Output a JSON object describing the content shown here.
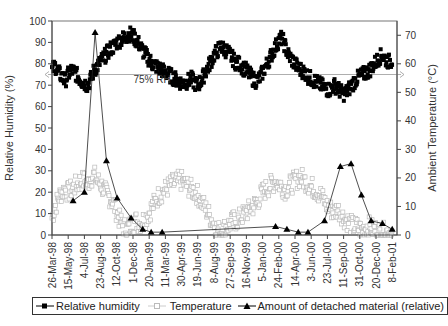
{
  "chart_data": {
    "type": "line",
    "title": "",
    "xlabel": "",
    "ylabel": "Relative  Humidity (%)",
    "ylabel_right": "Ambient Temperature (°C)",
    "ylim": [
      0,
      100
    ],
    "ylim_right": [
      0,
      75
    ],
    "yticks": [
      0,
      10,
      20,
      30,
      40,
      50,
      60,
      70,
      80,
      90,
      100
    ],
    "yticks_right": [
      0,
      10,
      20,
      30,
      40,
      50,
      60,
      70
    ],
    "grid": false,
    "legend_position": "bottom",
    "x_tick_labels": [
      "26-Mar-98",
      "15-May-98",
      "4-Jul-98",
      "23-Aug-98",
      "12-Oct-98",
      "1-Dec-98",
      "20-Jan-99",
      "11-Mar-99",
      "30-Apr-99",
      "19-Jun-99",
      "8-Aug-99",
      "27-Sep-99",
      "16-Nov-99",
      "5-Jan-00",
      "24-Feb-00",
      "14-Apr-00",
      "3-Jun-00",
      "23-Jul-00",
      "11-Sep-00",
      "31-Oct-00",
      "20-Dec-00",
      "8-Feb-01"
    ],
    "x_tick_interval_days": 50,
    "annotations": [
      {
        "text": "75% RH",
        "type": "horizontal_line",
        "axis": "left",
        "value": 75
      }
    ],
    "series": [
      {
        "name": "Relative humidity",
        "axis": "left",
        "marker": "filled-square",
        "color": "#000000",
        "x_days": [
          0,
          10,
          20,
          30,
          40,
          50,
          60,
          70,
          80,
          90,
          100,
          110,
          120,
          130,
          140,
          150,
          160,
          170,
          180,
          190,
          200,
          210,
          220,
          230,
          240,
          250,
          260,
          270,
          280,
          290,
          300,
          310,
          320,
          330,
          340,
          350,
          360,
          370,
          380,
          390,
          400,
          410,
          420,
          430,
          440,
          450,
          460,
          470,
          480,
          490,
          500,
          510,
          520,
          530,
          540,
          550,
          560,
          570,
          580,
          590,
          600,
          610,
          620,
          630,
          640,
          650,
          660,
          670,
          680,
          690,
          700,
          710,
          720,
          730,
          740,
          750,
          760,
          770,
          780,
          790,
          800,
          810,
          820,
          830,
          840,
          850,
          860,
          870,
          880,
          890,
          900,
          910,
          920,
          930,
          940,
          950,
          960,
          970,
          980,
          990,
          1000,
          1010,
          1020,
          1030,
          1040,
          1050
        ],
        "values": [
          77,
          79,
          76,
          74,
          72,
          75,
          77,
          76,
          74,
          72,
          71,
          70,
          73,
          77,
          79,
          81,
          83,
          85,
          87,
          88,
          90,
          91,
          92,
          93,
          94,
          93,
          91,
          89,
          86,
          84,
          82,
          80,
          79,
          78,
          77,
          76,
          75,
          74,
          73,
          72,
          71,
          71,
          72,
          73,
          71,
          70,
          72,
          75,
          78,
          81,
          84,
          86,
          88,
          87,
          86,
          84,
          82,
          80,
          80,
          78,
          77,
          75,
          73,
          72,
          73,
          76,
          79,
          82,
          85,
          88,
          91,
          92,
          88,
          84,
          82,
          80,
          78,
          77,
          76,
          74,
          73,
          72,
          71,
          70,
          69,
          68,
          68,
          70,
          69,
          67,
          66,
          67,
          69,
          71,
          73,
          74,
          75,
          76,
          77,
          79,
          81,
          83,
          84,
          82,
          81,
          82
        ]
      },
      {
        "name": "Temperature",
        "axis": "right",
        "marker": "hollow-square",
        "color": "#bbbbbb",
        "x_days": [
          0,
          10,
          20,
          30,
          40,
          50,
          60,
          70,
          80,
          90,
          100,
          110,
          120,
          130,
          140,
          150,
          160,
          170,
          180,
          190,
          200,
          210,
          220,
          230,
          240,
          250,
          260,
          270,
          280,
          290,
          300,
          310,
          320,
          330,
          340,
          350,
          360,
          370,
          380,
          390,
          400,
          410,
          420,
          430,
          440,
          450,
          460,
          470,
          480,
          490,
          500,
          510,
          520,
          530,
          540,
          550,
          560,
          570,
          580,
          590,
          600,
          610,
          620,
          630,
          640,
          650,
          660,
          670,
          680,
          690,
          700,
          710,
          720,
          730,
          740,
          750,
          760,
          770,
          780,
          790,
          800,
          810,
          820,
          830,
          840,
          850,
          860,
          870,
          880,
          890,
          900,
          910,
          920,
          930,
          940,
          950,
          960,
          970,
          980,
          990,
          1000,
          1010,
          1020,
          1030,
          1040,
          1050
        ],
        "values": [
          6,
          10,
          13,
          15,
          16,
          15,
          16,
          17,
          18,
          19,
          19,
          18,
          20,
          21,
          19,
          18,
          16,
          14,
          13,
          11,
          8,
          5,
          3,
          2,
          3,
          4,
          5,
          4,
          5,
          6,
          8,
          10,
          12,
          14,
          15,
          16,
          17,
          18,
          18,
          19,
          19,
          18,
          17,
          16,
          15,
          14,
          12,
          10,
          8,
          6,
          4,
          2,
          1,
          2,
          3,
          4,
          5,
          5,
          6,
          7,
          8,
          9,
          10,
          11,
          13,
          15,
          16,
          17,
          18,
          19,
          18,
          17,
          16,
          17,
          18,
          19,
          20,
          20,
          19,
          18,
          17,
          16,
          15,
          14,
          12,
          10,
          9,
          8,
          9,
          8,
          6,
          5,
          4,
          3,
          3,
          2,
          2,
          3,
          3,
          2,
          2,
          1,
          1,
          1,
          1,
          1
        ]
      },
      {
        "name": "Amount of detached material (relative)",
        "axis": "right",
        "marker": "filled-triangle",
        "color": "#000000",
        "x_days": [
          65,
          100,
          133,
          168,
          201,
          244,
          280,
          306,
          340,
          690,
          725,
          760,
          790,
          841,
          890,
          923,
          955,
          985,
          1020,
          1050
        ],
        "values": [
          12,
          15,
          71,
          26,
          13,
          6,
          2,
          1,
          1,
          3,
          2,
          1,
          1,
          5,
          24,
          25,
          14,
          5,
          4,
          2,
          1
        ],
        "note": "values read in right-axis units (0–75)"
      }
    ]
  },
  "legend": {
    "items": [
      {
        "label": "Relative humidity"
      },
      {
        "label": "Temperature"
      },
      {
        "label": "Amount of detached material (relative)"
      }
    ]
  }
}
